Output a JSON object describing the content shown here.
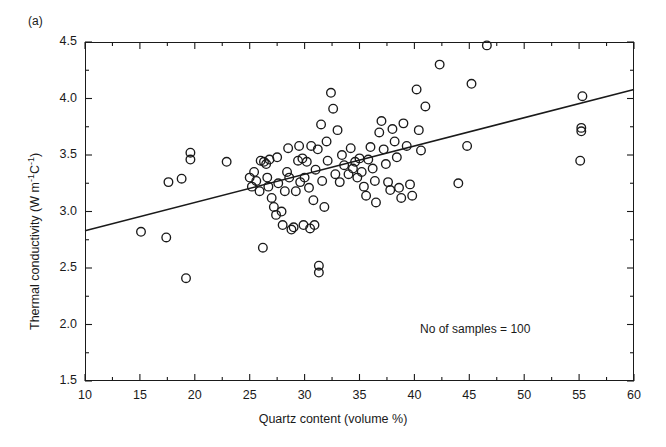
{
  "figure": {
    "panel_label": "(a)",
    "annotation": "No of samples = 100"
  },
  "axes": {
    "x_title": "Quartz content (volume %)",
    "y_title_main": "Thermal conductivity (W m",
    "y_title_sup1": "-1",
    "y_title_mid": "C",
    "y_title_sup2": "-1",
    "y_title_close": ")",
    "x_ticks": [
      "10",
      "15",
      "20",
      "25",
      "30",
      "35",
      "40",
      "45",
      "50",
      "55",
      "60"
    ],
    "y_ticks": [
      "4.5",
      "4.0",
      "3.5",
      "3.0",
      "2.5",
      "2.0",
      "1.5"
    ]
  },
  "chart_data": {
    "type": "scatter",
    "title": "",
    "xlabel": "Quartz content (volume %)",
    "ylabel": "Thermal conductivity (W m^-1 C^-1)",
    "xlim": [
      10,
      60
    ],
    "ylim": [
      1.5,
      4.5
    ],
    "xticks": [
      10,
      15,
      20,
      25,
      30,
      35,
      40,
      45,
      50,
      55,
      60
    ],
    "yticks": [
      1.5,
      2.0,
      2.5,
      3.0,
      3.5,
      4.0,
      4.5
    ],
    "x_minor_step": 2.5,
    "y_minor_step": 0.25,
    "grid": false,
    "legend": null,
    "marker": "open-circle",
    "marker_color": "#1a1a1a",
    "n_samples": 100,
    "annotations": [
      {
        "text": "No of samples = 100",
        "x": 40.5,
        "y": 2.02
      },
      {
        "text": "(a)",
        "x": 10.0,
        "y": 4.62
      }
    ],
    "trendline": {
      "type": "linear-fit",
      "x": [
        10,
        60
      ],
      "y": [
        2.83,
        4.08
      ],
      "color": "#1a1a1a"
    },
    "points": [
      [
        15.1,
        2.82
      ],
      [
        17.6,
        3.26
      ],
      [
        18.8,
        3.29
      ],
      [
        19.2,
        2.41
      ],
      [
        19.6,
        3.52
      ],
      [
        19.6,
        3.46
      ],
      [
        17.4,
        2.77
      ],
      [
        22.9,
        3.44
      ],
      [
        25.0,
        3.3
      ],
      [
        25.2,
        3.22
      ],
      [
        25.4,
        3.35
      ],
      [
        25.6,
        3.27
      ],
      [
        25.9,
        3.18
      ],
      [
        26.0,
        3.45
      ],
      [
        26.3,
        3.44
      ],
      [
        26.5,
        3.42
      ],
      [
        26.6,
        3.3
      ],
      [
        26.7,
        3.22
      ],
      [
        26.8,
        3.46
      ],
      [
        26.2,
        2.68
      ],
      [
        27.0,
        3.12
      ],
      [
        27.2,
        3.04
      ],
      [
        27.4,
        2.97
      ],
      [
        27.5,
        3.48
      ],
      [
        27.6,
        3.25
      ],
      [
        27.9,
        3.0
      ],
      [
        28.0,
        2.88
      ],
      [
        28.2,
        3.18
      ],
      [
        28.4,
        3.35
      ],
      [
        28.5,
        3.56
      ],
      [
        28.6,
        3.3
      ],
      [
        28.8,
        2.84
      ],
      [
        29.0,
        2.86
      ],
      [
        29.2,
        3.18
      ],
      [
        29.4,
        3.45
      ],
      [
        29.5,
        3.58
      ],
      [
        29.6,
        3.26
      ],
      [
        29.8,
        3.47
      ],
      [
        29.9,
        2.88
      ],
      [
        30.0,
        3.3
      ],
      [
        30.2,
        3.44
      ],
      [
        30.4,
        3.21
      ],
      [
        30.5,
        2.85
      ],
      [
        30.6,
        3.58
      ],
      [
        30.8,
        3.1
      ],
      [
        30.9,
        2.88
      ],
      [
        31.0,
        3.37
      ],
      [
        31.2,
        3.55
      ],
      [
        31.3,
        2.52
      ],
      [
        31.3,
        2.46
      ],
      [
        31.5,
        3.77
      ],
      [
        31.6,
        3.27
      ],
      [
        31.8,
        3.04
      ],
      [
        32.0,
        3.62
      ],
      [
        32.1,
        3.45
      ],
      [
        32.4,
        4.05
      ],
      [
        32.6,
        3.91
      ],
      [
        32.8,
        3.33
      ],
      [
        33.0,
        3.72
      ],
      [
        33.2,
        3.26
      ],
      [
        33.4,
        3.5
      ],
      [
        33.6,
        3.41
      ],
      [
        34.0,
        3.33
      ],
      [
        34.2,
        3.56
      ],
      [
        34.4,
        3.38
      ],
      [
        34.6,
        3.44
      ],
      [
        34.8,
        3.3
      ],
      [
        35.0,
        3.47
      ],
      [
        35.2,
        3.35
      ],
      [
        35.4,
        3.22
      ],
      [
        35.6,
        3.14
      ],
      [
        35.8,
        3.46
      ],
      [
        36.0,
        3.57
      ],
      [
        36.2,
        3.38
      ],
      [
        36.4,
        3.27
      ],
      [
        36.5,
        3.08
      ],
      [
        36.8,
        3.7
      ],
      [
        37.0,
        3.8
      ],
      [
        37.2,
        3.55
      ],
      [
        37.4,
        3.42
      ],
      [
        37.6,
        3.26
      ],
      [
        37.8,
        3.19
      ],
      [
        38.0,
        3.73
      ],
      [
        38.2,
        3.62
      ],
      [
        38.4,
        3.48
      ],
      [
        38.6,
        3.21
      ],
      [
        38.8,
        3.12
      ],
      [
        39.0,
        3.78
      ],
      [
        39.3,
        3.58
      ],
      [
        39.6,
        3.24
      ],
      [
        39.8,
        3.14
      ],
      [
        40.2,
        4.08
      ],
      [
        40.4,
        3.72
      ],
      [
        40.6,
        3.54
      ],
      [
        41.0,
        3.93
      ],
      [
        42.3,
        4.3
      ],
      [
        44.0,
        3.25
      ],
      [
        44.8,
        3.58
      ],
      [
        45.2,
        4.13
      ],
      [
        46.6,
        4.47
      ],
      [
        55.1,
        3.45
      ],
      [
        55.2,
        3.74
      ],
      [
        55.2,
        3.71
      ],
      [
        55.3,
        4.02
      ]
    ]
  }
}
